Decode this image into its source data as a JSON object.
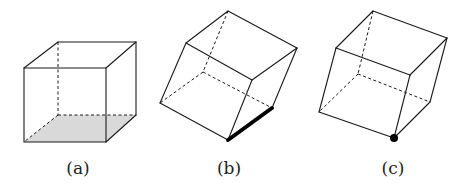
{
  "figure": {
    "panels": [
      {
        "label": "(a)",
        "description": "Cube resting on a face; bottom face shaded",
        "shaded_face_color": "#d9d9d9"
      },
      {
        "label": "(b)",
        "description": "Cube tilted, balanced on an edge; contact edge drawn thick"
      },
      {
        "label": "(c)",
        "description": "Cube tilted, balanced on a vertex; contact vertex marked with dot"
      }
    ],
    "line_color": "#1a1a1a",
    "highlight_color": "#000000"
  }
}
